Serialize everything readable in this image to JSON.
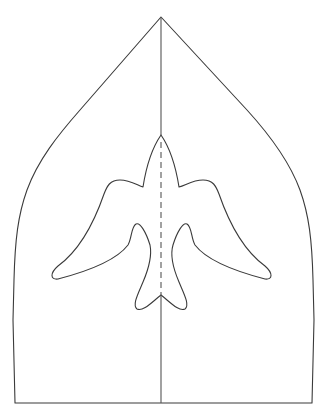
{
  "diagram": {
    "type": "papercraft-template",
    "description": "Folded card outline with pointed arched top and a bird (swallow/dove) cut-out shape centered on the fold line",
    "parts": [
      {
        "id": "card-outline",
        "label": "Card outline",
        "line_style": "solid"
      },
      {
        "id": "center-fold-upper",
        "label": "Center fold (above bird)",
        "line_style": "solid"
      },
      {
        "id": "bird-outline",
        "label": "Bird cut-out outline",
        "line_style": "solid"
      },
      {
        "id": "bird-fold",
        "label": "Bird fold line",
        "line_style": "dashed"
      },
      {
        "id": "center-fold-lower",
        "label": "Center fold (below bird)",
        "line_style": "solid"
      }
    ],
    "colors": {
      "background": "#ffffff",
      "line": "#3a3a3a",
      "fold": "#555555"
    }
  }
}
